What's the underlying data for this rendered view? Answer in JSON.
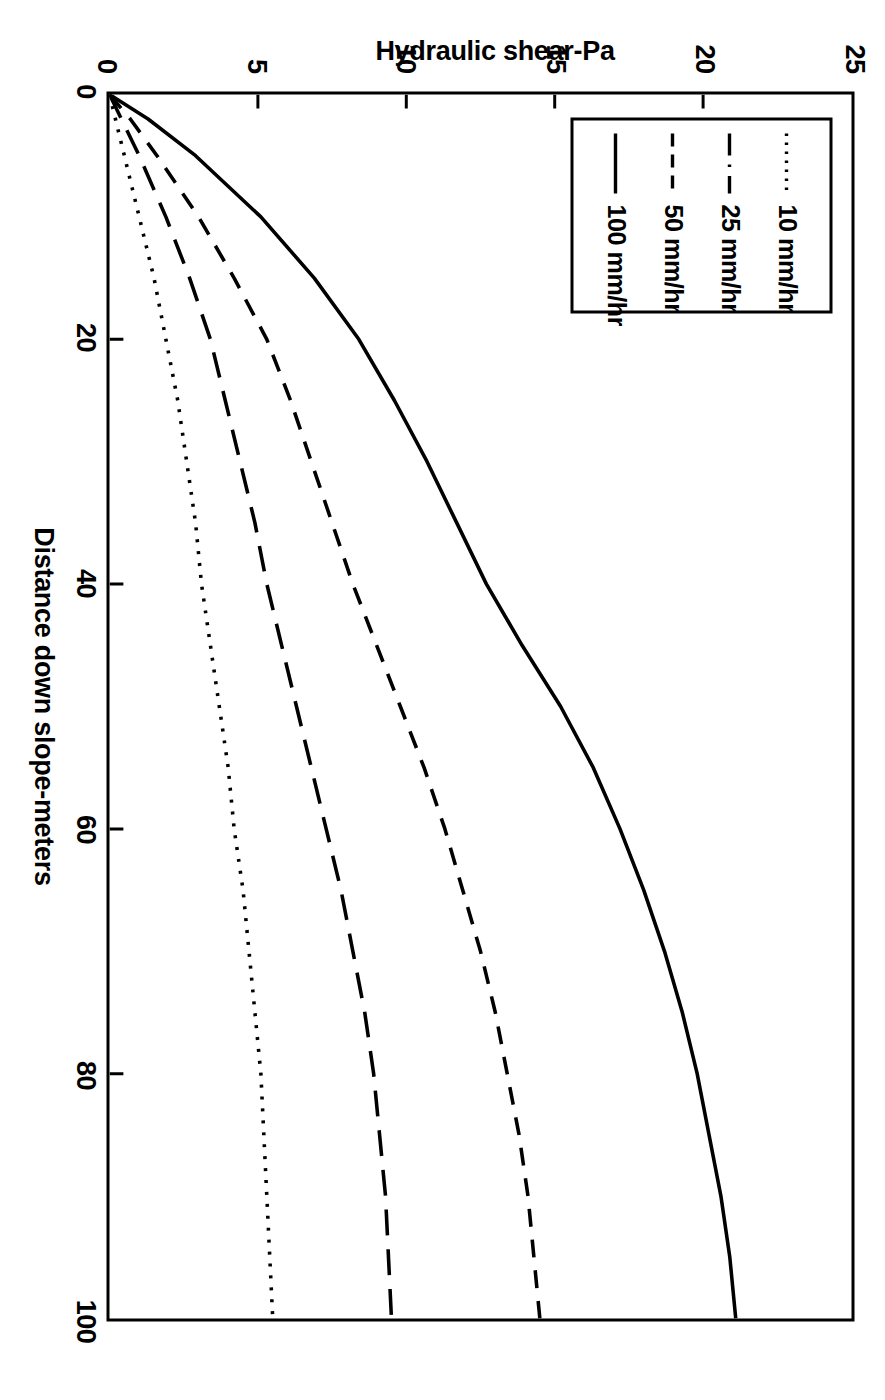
{
  "chart_data": {
    "type": "line",
    "title": "",
    "xlabel": "Distance down slope-meters",
    "ylabel": "Hydraulic shear-Pa",
    "xlim": [
      0,
      100
    ],
    "ylim": [
      0,
      25
    ],
    "xticks": [
      "0",
      "20",
      "40",
      "60",
      "80",
      "100"
    ],
    "xtick_values": [
      0,
      20,
      40,
      60,
      80,
      100
    ],
    "yticks": [
      "0",
      "5",
      "10",
      "15",
      "20",
      "25"
    ],
    "ytick_values": [
      0,
      5,
      10,
      15,
      20,
      25
    ],
    "grid": false,
    "legend_position": "bottom-left",
    "x": [
      0,
      2,
      5,
      10,
      15,
      20,
      25,
      30,
      35,
      40,
      45,
      50,
      55,
      60,
      65,
      70,
      75,
      80,
      85,
      90,
      95,
      100
    ],
    "series": [
      {
        "name": "100 mm/hr",
        "label": "100 mm/hr",
        "style": "solid",
        "dash": "none",
        "color": "#000000",
        "values": [
          0.0,
          1.3,
          2.9,
          5.1,
          6.9,
          8.4,
          9.6,
          10.7,
          11.7,
          12.7,
          13.9,
          15.2,
          16.3,
          17.2,
          18.0,
          18.7,
          19.3,
          19.8,
          20.2,
          20.6,
          20.9,
          21.1
        ]
      },
      {
        "name": "50 mm/hr",
        "label": "50 mm/hr",
        "style": "dashed",
        "dash": "18,13",
        "color": "#000000",
        "values": [
          0.0,
          0.7,
          1.6,
          3.0,
          4.2,
          5.3,
          6.1,
          6.8,
          7.5,
          8.2,
          9.0,
          9.8,
          10.6,
          11.3,
          11.9,
          12.5,
          13.0,
          13.4,
          13.8,
          14.1,
          14.3,
          14.5
        ]
      },
      {
        "name": "25 mm/hr",
        "label": "25 mm/hr",
        "style": "dashdot",
        "dash": "26,14",
        "color": "#000000",
        "values": [
          0.0,
          0.4,
          1.0,
          1.9,
          2.7,
          3.4,
          3.9,
          4.4,
          4.9,
          5.3,
          5.8,
          6.3,
          6.8,
          7.3,
          7.8,
          8.2,
          8.6,
          8.9,
          9.1,
          9.3,
          9.4,
          9.5
        ]
      },
      {
        "name": "10 mm/hr",
        "label": "10 mm/hr",
        "style": "dotted",
        "dash": "3,9",
        "color": "#000000",
        "values": [
          0.0,
          0.2,
          0.5,
          1.0,
          1.5,
          1.9,
          2.3,
          2.6,
          2.9,
          3.1,
          3.4,
          3.7,
          4.0,
          4.2,
          4.5,
          4.7,
          4.9,
          5.1,
          5.2,
          5.3,
          5.4,
          5.5
        ]
      }
    ]
  },
  "legend": {
    "entries": [
      {
        "label": "10  mm/hr",
        "swatch": "dotted-line-swatch"
      },
      {
        "label": "25 mm/hr",
        "swatch": "dashdot-line-swatch"
      },
      {
        "label": "50 mm/hr",
        "swatch": "dashed-line-swatch"
      },
      {
        "label": "100 mm/hr",
        "swatch": "solid-line-swatch"
      }
    ]
  },
  "axes": {
    "x_title": "Distance down slope-meters",
    "y_title": "Hydraulic shear-Pa",
    "x_tick_labels": [
      "0",
      "20",
      "40",
      "60",
      "80",
      "100"
    ],
    "y_tick_labels": [
      "0",
      "5",
      "10",
      "15",
      "20",
      "25"
    ]
  }
}
